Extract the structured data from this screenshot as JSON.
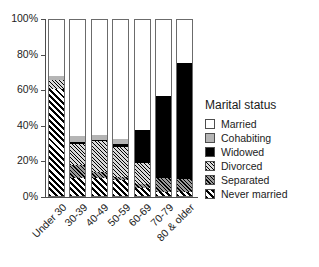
{
  "chart_data": {
    "type": "bar",
    "subtype": "stacked-100-percent",
    "title": "",
    "xlabel": "",
    "ylabel": "",
    "ylim": [
      0,
      100
    ],
    "yticks": [
      "0%",
      "20%",
      "40%",
      "60%",
      "80%",
      "100%"
    ],
    "ytick_values": [
      0,
      20,
      40,
      60,
      80,
      100
    ],
    "grid": false,
    "legend_position": "right",
    "legend_title": "Marital status",
    "categories": [
      "Under 30",
      "30-39",
      "40-49",
      "50-59",
      "60-69",
      "70-79",
      "80 & older"
    ],
    "series": [
      {
        "name": "Never married",
        "color": "#ffffff",
        "pattern": "bold-diagonal-hatch",
        "values": [
          60.0,
          10.0,
          10.0,
          9.0,
          4.5,
          2.5,
          2.0
        ]
      },
      {
        "name": "Separated",
        "color": "#9a9a9a",
        "pattern": "dense-diagonal-hatch",
        "values": [
          0.0,
          7.5,
          3.5,
          1.5,
          2.0,
          7.5,
          7.5
        ]
      },
      {
        "name": "Divorced",
        "color": "#d9d9d9",
        "pattern": "fine-diagonal-hatch",
        "values": [
          5.0,
          11.5,
          17.5,
          17.0,
          12.0,
          0.0,
          0.0
        ]
      },
      {
        "name": "Widowed",
        "color": "#000000",
        "pattern": "solid",
        "values": [
          0.0,
          1.5,
          0.5,
          1.5,
          18.5,
          46.0,
          65.0
        ]
      },
      {
        "name": "Cohabiting",
        "color": "#b5b5b5",
        "pattern": "solid-light-gray",
        "values": [
          2.5,
          3.5,
          3.0,
          3.0,
          0.0,
          0.0,
          0.0
        ]
      },
      {
        "name": "Married",
        "color": "#ffffff",
        "pattern": "empty",
        "values": [
          32.5,
          66.0,
          65.5,
          68.0,
          63.0,
          44.0,
          25.5
        ]
      }
    ],
    "legend_order": [
      "Married",
      "Cohabiting",
      "Widowed",
      "Divorced",
      "Separated",
      "Never married"
    ],
    "stack_order_bottom_to_top": [
      "Never married",
      "Separated",
      "Divorced",
      "Widowed",
      "Cohabiting",
      "Married"
    ]
  }
}
